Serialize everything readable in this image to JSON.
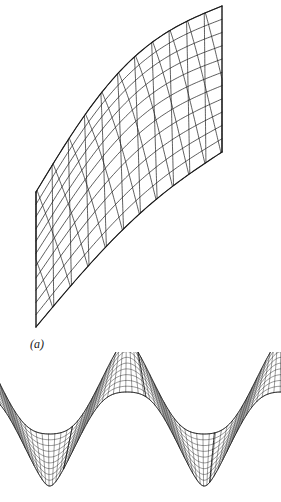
{
  "page": {
    "background_color": "#ffffff",
    "ink_color": "#1a1a1a",
    "width": 281,
    "height": 502
  },
  "figures": [
    {
      "id": "figure-a",
      "caption": "(a)",
      "caption_visible_text": "(a)",
      "description": "Twisted ruled quadrilateral surface patch rendered as a diamond lattice wireframe mesh",
      "mesh": {
        "type": "wireframe-lattice",
        "u_divisions": 11,
        "v_divisions": 11,
        "line_color": "#1a1a1a",
        "line_width": 0.7,
        "fill": "none"
      },
      "boundary": {
        "left_edge": {
          "x": 36,
          "y_top": 192,
          "y_bottom": 327,
          "straight": true
        },
        "right_edge": {
          "x": 222,
          "y_top": 6,
          "y_bottom": 152,
          "straight": true
        }
      },
      "corners": [
        {
          "label": "left-top",
          "x": 36,
          "y": 192
        },
        {
          "label": "left-bottom",
          "x": 36,
          "y": 327
        },
        {
          "label": "right-top",
          "x": 222,
          "y": 6
        },
        {
          "label": "right-bottom",
          "x": 222,
          "y": 152
        }
      ]
    },
    {
      "id": "figure-b",
      "caption": "(b)",
      "caption_visible_text": ")",
      "caption_note": "label is clipped by the left page margin",
      "description": "Sinusoidal corrugated ribbon surface rendered as a fine quadrilateral wireframe mesh, cropped at both side margins",
      "mesh": {
        "type": "wireframe-lattice",
        "u_divisions": 64,
        "v_divisions": 9,
        "line_color": "#1a1a1a",
        "line_width": 0.45,
        "fill": "none"
      },
      "wave": {
        "shape": "sine",
        "cycles": 2,
        "crest_y": 366,
        "trough_y": 460,
        "band_half_width": 26,
        "x_start": -14,
        "x_end": 295
      },
      "highlight_lines": [
        {
          "label": "crest-rib-left",
          "x": 68
        },
        {
          "label": "trough-rib-middle",
          "x": 142
        },
        {
          "label": "crest-rib-right",
          "x": 212
        }
      ]
    }
  ]
}
